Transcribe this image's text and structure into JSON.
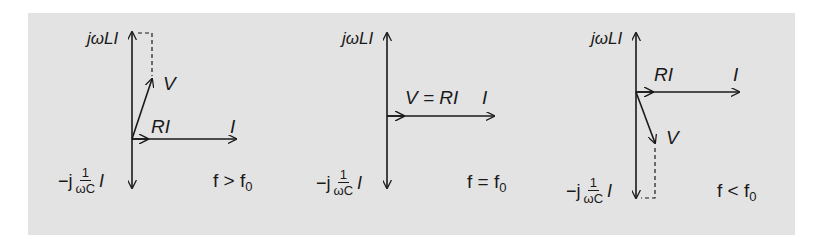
{
  "figure": {
    "background": "#e3e3e3",
    "stroke": "#1a1a1a",
    "diagrams": [
      {
        "id": "above-resonance",
        "condition": {
          "f": "f",
          "op": ">",
          "f0": "f",
          "sub": "0"
        },
        "labels": {
          "inductive": "jωLI",
          "capacitive_prefix": "−j",
          "capacitive_num": "1",
          "capacitive_den": "ωC",
          "capacitive_suffix": "I",
          "resistive": "RI",
          "current": "I",
          "voltage": "V"
        }
      },
      {
        "id": "at-resonance",
        "condition": {
          "f": "f",
          "op": "=",
          "f0": "f",
          "sub": "0"
        },
        "labels": {
          "inductive": "jωLI",
          "capacitive_prefix": "−j",
          "capacitive_num": "1",
          "capacitive_den": "ωC",
          "capacitive_suffix": "I",
          "resistive": "V = RI",
          "current": "I"
        }
      },
      {
        "id": "below-resonance",
        "condition": {
          "f": "f",
          "op": "<",
          "f0": "f",
          "sub": "0"
        },
        "labels": {
          "inductive": "jωLI",
          "capacitive_prefix": "−j",
          "capacitive_num": "1",
          "capacitive_den": "ωC",
          "capacitive_suffix": "I",
          "resistive": "RI",
          "current": "I",
          "voltage": "V"
        }
      }
    ]
  }
}
